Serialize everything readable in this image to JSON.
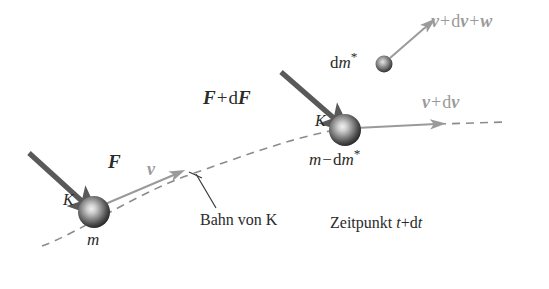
{
  "diagram": {
    "title": "Bahn von K",
    "colors": {
      "force_arrow": "#595959",
      "velocity_arrow": "#9a9a9a",
      "trajectory": "#8c8c8c",
      "text_dark": "#2b2b2b",
      "text_gray": "#9a9a9a",
      "sphere_dark": "#2e2e2e",
      "sphere_light": "#d9d9d9",
      "background": "#ffffff"
    },
    "labels": {
      "force_t": "F",
      "body_name_t": "K",
      "mass_t": "m",
      "velocity_t": "v",
      "force_t_dt_part1": "F",
      "force_t_dt_op": "+",
      "force_t_dt_d": "d",
      "force_t_dt_part2": "F",
      "body_name_t_dt": "K",
      "mass_t_dt_m": "m",
      "mass_t_dt_op": "−",
      "mass_t_dt_d": "d",
      "mass_t_dt_m2": "m",
      "mass_t_dt_star": "*",
      "velocity_t_dt_v": "v",
      "velocity_t_dt_op": "+",
      "velocity_t_dt_d": "d",
      "velocity_t_dt_v2": "v",
      "ejected_mass_d": "d",
      "ejected_mass_m": "m",
      "ejected_mass_star": "*",
      "ejected_velocity_v": "v",
      "ejected_velocity_op1": "+",
      "ejected_velocity_d": "d",
      "ejected_velocity_v2": "v",
      "ejected_velocity_op2": "+",
      "ejected_velocity_w": "w",
      "trajectory_caption": "Bahn von K",
      "time_caption_word": "Zeitpunkt",
      "time_caption_t": "t",
      "time_caption_op": "+",
      "time_caption_d": "d",
      "time_caption_t2": "t"
    }
  }
}
